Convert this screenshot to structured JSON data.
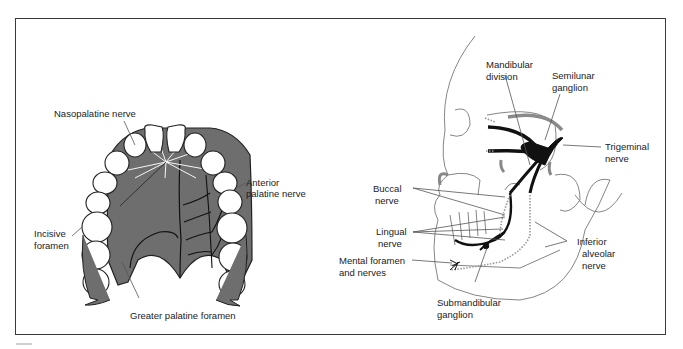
{
  "figure": {
    "panels": [
      {
        "id": "palate",
        "description": "Inferior view of hard palate with maxillary teeth",
        "labels": {
          "nasopalatine": "Nasopalatine nerve",
          "anterior_palatine_1": "Anterior",
          "anterior_palatine_2": "palatine nerve",
          "incisive_1": "Incisive",
          "incisive_2": "foramen",
          "greater_palatine": "Greater palatine foramen"
        }
      },
      {
        "id": "skull",
        "description": "Lateral view of skull showing trigeminal nerve mandibular branches",
        "labels": {
          "mandibular_1": "Mandibular",
          "mandibular_2": "division",
          "semilunar_1": "Semilunar",
          "semilunar_2": "ganglion",
          "trigeminal_1": "Trigeminal",
          "trigeminal_2": "nerve",
          "buccal_1": "Buccal",
          "buccal_2": "nerve",
          "lingual_1": "Lingual",
          "lingual_2": "nerve",
          "mental_1": "Mental foramen",
          "mental_2": "and nerves",
          "inferior_alveolar_1": "Inferior",
          "inferior_alveolar_2": "alveolar",
          "inferior_alveolar_3": "nerve",
          "submandibular_1": "Submandibular",
          "submandibular_2": "ganglion"
        }
      }
    ],
    "colors": {
      "border": "#3a3a3a",
      "palate_fill": "#6e6e6e",
      "nerve": "#111111",
      "line": "#555555"
    }
  }
}
